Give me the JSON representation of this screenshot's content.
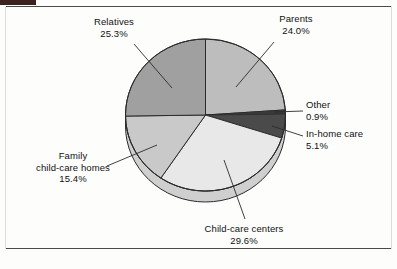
{
  "chart_data": {
    "type": "pie",
    "title": "",
    "subtitle": "",
    "xlabel": "",
    "ylabel": "",
    "legend_position": "none",
    "grid": false,
    "labels_outside": true,
    "leader_lines": true,
    "three_d": true,
    "start_angle_deg": 0,
    "direction": "clockwise",
    "unit": "%",
    "categories": [
      "Parents",
      "Other",
      "In-home care",
      "Child-care centers",
      "Family child-care homes",
      "Relatives"
    ],
    "values": [
      24.0,
      0.9,
      5.1,
      29.6,
      15.4,
      25.3
    ],
    "value_labels": [
      "24.0%",
      "0.9%",
      "5.1%",
      "29.6%",
      "15.4%",
      "25.3%"
    ],
    "colors": [
      "#bdbdbd",
      "#3a3a3a",
      "#4a4a4a",
      "#e8e8e8",
      "#c9c9c9",
      "#a0a0a0"
    ],
    "slices": [
      {
        "name": "Parents",
        "value": 24.0,
        "value_label": "24.0%",
        "color": "#bdbdbd"
      },
      {
        "name": "Other",
        "value": 0.9,
        "value_label": "0.9%",
        "color": "#3a3a3a"
      },
      {
        "name": "In-home care",
        "value": 5.1,
        "value_label": "5.1%",
        "color": "#4a4a4a"
      },
      {
        "name": "Child-care centers",
        "value": 29.6,
        "value_label": "29.6%",
        "color": "#e8e8e8"
      },
      {
        "name": "Family child-care homes",
        "value": 15.4,
        "value_label": "15.4%",
        "color": "#c9c9c9"
      },
      {
        "name": "Relatives",
        "value": 25.3,
        "value_label": "25.3%",
        "color": "#a0a0a0"
      }
    ]
  },
  "labels": {
    "relatives": {
      "name": "Relatives",
      "pct": "25.3%"
    },
    "parents": {
      "name": "Parents",
      "pct": "24.0%"
    },
    "other": {
      "name": "Other",
      "pct": "0.9%"
    },
    "inhome": {
      "name": "In-home care",
      "pct": "5.1%"
    },
    "family": {
      "line1": "Family",
      "line2": "child-care homes",
      "pct": "15.4%"
    },
    "centers": {
      "name": "Child-care centers",
      "pct": "29.6%"
    }
  },
  "style": {
    "outline_color": "#2b2b2b",
    "rule_color": "#4a4a4a",
    "corner_mark_color": "#3b2320",
    "background": "#fdfdfc"
  }
}
